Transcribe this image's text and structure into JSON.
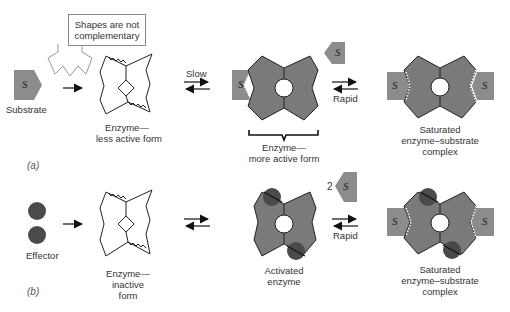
{
  "callout": {
    "text_line1": "Shapes are not",
    "text_line2": "complementary"
  },
  "row_a": {
    "panel_label": "(a)",
    "substrate": {
      "glyph": "S",
      "label": "Substrate"
    },
    "enzyme_less_active": {
      "line1": "Enzyme—",
      "line2": "less active form"
    },
    "arrow_slow": {
      "label": "Slow"
    },
    "enzyme_more_active": {
      "line1": "Enzyme—",
      "line2": "more active form"
    },
    "arrow_rapid": {
      "label": "Rapid"
    },
    "free_substrate": {
      "glyph": "S"
    },
    "complex": {
      "line1": "Saturated",
      "line2": "enzyme–substrate",
      "line3": "complex"
    }
  },
  "row_b": {
    "panel_label": "(b)",
    "effector": {
      "label": "Effector"
    },
    "enzyme_inactive": {
      "line1": "Enzyme—",
      "line2": "inactive",
      "line3": "form"
    },
    "activated": {
      "line1": "Activated",
      "line2": "enzyme"
    },
    "substrate_count": "2",
    "free_substrate": {
      "glyph": "S"
    },
    "arrow_rapid": {
      "label": "Rapid"
    },
    "complex": {
      "line1": "Saturated",
      "line2": "enzyme–substrate",
      "line3": "complex"
    }
  },
  "colors": {
    "enzyme_fill": "#7a7a7a",
    "substrate_fill": "#8c8c8c",
    "effector_fill": "#4a4a4a",
    "outline": "#222222"
  }
}
